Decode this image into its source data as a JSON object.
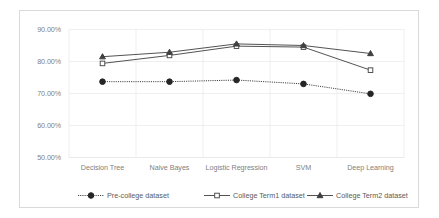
{
  "chart_data": {
    "type": "line",
    "title": "",
    "subtitle": "",
    "xlabel": "",
    "ylabel": "",
    "categories": [
      "Decision Tree",
      "Naive Bayes",
      "Logistic Regression",
      "SVM",
      "Deep Learning"
    ],
    "ylim": [
      50.0,
      90.0
    ],
    "ytick_labels": [
      "90.00%",
      "80.00%",
      "70.00%",
      "60.00%",
      "50.00%"
    ],
    "ytick_values": [
      90.0,
      80.0,
      70.0,
      60.0,
      50.0
    ],
    "grid": true,
    "grid_color": "#e8e8e8",
    "legend_position": "bottom",
    "series": [
      {
        "name": "Pre-college dataset",
        "values": [
          73.7,
          73.7,
          74.2,
          73.0,
          69.9
        ],
        "marker": "circle-filled",
        "line_style": "dotted",
        "color": "#262626"
      },
      {
        "name": "College Term1 dataset",
        "values": [
          79.4,
          81.9,
          84.8,
          84.5,
          77.3
        ],
        "marker": "square-open",
        "line_style": "solid",
        "color": "#404040"
      },
      {
        "name": "College Term2 dataset",
        "values": [
          81.5,
          82.9,
          85.5,
          85.0,
          82.5
        ],
        "marker": "triangle-filled",
        "line_style": "solid",
        "color": "#404040"
      }
    ]
  },
  "legend": {
    "items": [
      {
        "label": "Pre-college dataset"
      },
      {
        "label": "College Term1 dataset"
      },
      {
        "label": "College Term2 dataset"
      }
    ]
  }
}
